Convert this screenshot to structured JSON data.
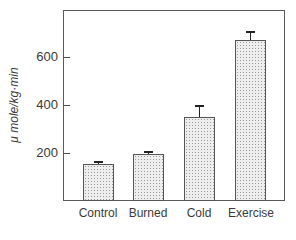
{
  "chart_data": {
    "type": "bar",
    "title": "",
    "xlabel": "",
    "ylabel": "μ mole/kg·min",
    "categories": [
      "Control",
      "Burned",
      "Cold",
      "Exercise"
    ],
    "values": [
      155,
      195,
      350,
      670
    ],
    "error_upper": [
      167,
      208,
      400,
      710
    ],
    "ylim": [
      0,
      795
    ],
    "yticks": [
      200,
      400,
      600
    ],
    "ytick_labels": [
      "200",
      "400",
      "600"
    ],
    "grid": false,
    "legend": null,
    "bar_fill": "stippled gray"
  },
  "colors": {
    "axis": "#5a5a5a",
    "bar_fill": "#eeeeee",
    "bar_stipple": "#9a9a9a",
    "error_bar": "#222222"
  }
}
